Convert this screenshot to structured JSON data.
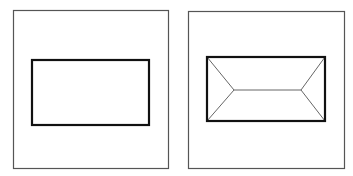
{
  "figure": {
    "colors": {
      "frame": "#555555",
      "rect": "#111111",
      "skeleton": "#666666",
      "background": "#ffffff"
    },
    "panels": [
      {
        "id": "left",
        "frame": {
          "x": 13,
          "y": 10,
          "w": 155,
          "h": 158
        },
        "rect": {
          "x": 32,
          "y": 60,
          "w": 117,
          "h": 65
        },
        "skeleton": []
      },
      {
        "id": "right",
        "frame": {
          "x": 188,
          "y": 11,
          "w": 156,
          "h": 157
        },
        "rect": {
          "x": 207,
          "y": 57,
          "w": 118,
          "h": 64
        },
        "skeleton": [
          [
            207,
            57,
            234,
            90
          ],
          [
            207,
            121,
            234,
            90
          ],
          [
            234,
            90,
            301,
            90
          ],
          [
            301,
            90,
            325,
            57
          ],
          [
            301,
            90,
            325,
            121
          ]
        ]
      }
    ]
  }
}
